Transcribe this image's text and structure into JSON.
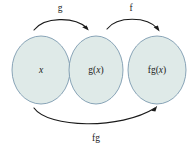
{
  "canvas": {
    "width": 192,
    "height": 153,
    "background": "#ffffff"
  },
  "theme": {
    "ellipse_fill": "#dfeae8",
    "ellipse_stroke": "#7d9bb0",
    "arrow_color": "#1a1a1a",
    "text_color": "#1a1a1a"
  },
  "diagram": {
    "type": "function-composition-mapping",
    "sets": [
      {
        "id": "domain",
        "label": "x",
        "italic": true,
        "cx": 41,
        "cy": 70,
        "rx": 29,
        "ry": 34
      },
      {
        "id": "intermediate",
        "label": "g(x)",
        "label_plain": "g(",
        "label_italic": "x",
        "label_tail": ")",
        "cx": 96,
        "cy": 70,
        "rx": 27,
        "ry": 34
      },
      {
        "id": "codomain",
        "label": "fg(x)",
        "label_plain": "fg(",
        "label_italic": "x",
        "label_tail": ")",
        "cx": 157,
        "cy": 70,
        "rx": 29,
        "ry": 34
      }
    ],
    "arrows": [
      {
        "id": "arrow-g",
        "label": "g",
        "from": "domain",
        "to": "intermediate",
        "label_x": 60,
        "label_y": 9
      },
      {
        "id": "arrow-f",
        "label": "f",
        "from": "intermediate",
        "to": "codomain",
        "label_x": 131,
        "label_y": 9
      },
      {
        "id": "arrow-fg",
        "label": "fg",
        "from": "domain",
        "to": "codomain",
        "label_x": 96,
        "label_y": 139
      }
    ]
  }
}
